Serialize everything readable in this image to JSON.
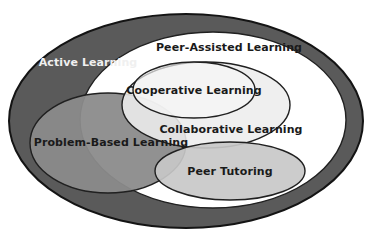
{
  "diagram": {
    "type": "euler-venn",
    "background": "#ffffff",
    "sets": [
      {
        "id": "active-learning",
        "label": "Active Learning",
        "fill": "#5a5a5a",
        "stroke": "#141414",
        "text_color": "#f0f0f0",
        "cx": 186,
        "cy": 121,
        "rx": 177,
        "ry": 107,
        "label_x": 88,
        "label_y": 63
      },
      {
        "id": "peer-assisted-learning",
        "label": "Peer-Assisted Learning",
        "fill": "#ffffff",
        "stroke": "#202020",
        "text_color": "#1a1a1a",
        "cx": 213,
        "cy": 120,
        "rx": 133,
        "ry": 88,
        "label_x": 229,
        "label_y": 48
      },
      {
        "id": "problem-based-learning",
        "label": "Problem-Based Learning",
        "fill": "#8b8b8b",
        "stroke": "#202020",
        "text_color": "#1a1a1a",
        "cx": 108,
        "cy": 143,
        "rx": 78,
        "ry": 50,
        "label_x": 111,
        "label_y": 143
      },
      {
        "id": "collaborative-learning",
        "label": "Collaborative Learning",
        "fill": "#ededed",
        "stroke": "#202020",
        "text_color": "#1a1a1a",
        "cx": 206,
        "cy": 105,
        "rx": 84,
        "ry": 43,
        "label_x": 231,
        "label_y": 130
      },
      {
        "id": "cooperative-learning",
        "label": "Cooperative Learning",
        "fill": "#f7f7f7",
        "stroke": "#202020",
        "text_color": "#1a1a1a",
        "cx": 194,
        "cy": 90,
        "rx": 61,
        "ry": 28,
        "label_x": 194,
        "label_y": 91
      },
      {
        "id": "peer-tutoring",
        "label": "Peer Tutoring",
        "fill": "#c8c8c8",
        "stroke": "#202020",
        "text_color": "#1a1a1a",
        "cx": 230,
        "cy": 171,
        "rx": 75,
        "ry": 29,
        "label_x": 230,
        "label_y": 172
      }
    ]
  }
}
